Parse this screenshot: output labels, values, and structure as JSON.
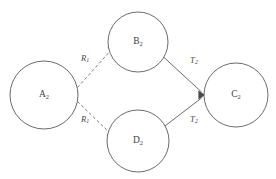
{
  "diagram": {
    "title": "",
    "background_color": "#ffffff",
    "node_stroke_color": "#5a5a5a",
    "edge_solid_color": "#5a5a5a",
    "edge_dashed_color": "#6a6a6a",
    "label_color": "#3d3d3d",
    "nodes": [
      {
        "id": "A2",
        "base": "A",
        "sub": "2",
        "cx": 44,
        "cy": 95,
        "r": 34
      },
      {
        "id": "B2",
        "base": "B",
        "sub": "2",
        "cx": 138,
        "cy": 42,
        "r": 30
      },
      {
        "id": "D2",
        "base": "D",
        "sub": "2",
        "cx": 138,
        "cy": 141,
        "r": 31
      },
      {
        "id": "C2",
        "base": "C",
        "sub": "2",
        "cx": 236,
        "cy": 95,
        "r": 32
      }
    ],
    "edges": [
      {
        "id": "A2-to-B2",
        "from": "A2",
        "to": "B2",
        "style": "dashed",
        "arrow": true,
        "base": "R",
        "sub": "1",
        "label_x": 85,
        "label_y": 59
      },
      {
        "id": "A2-to-D2",
        "from": "A2",
        "to": "D2",
        "style": "dashed",
        "arrow": true,
        "base": "R",
        "sub": "1",
        "label_x": 85,
        "label_y": 120
      },
      {
        "id": "B2-to-C2",
        "from": "B2",
        "to": "C2",
        "style": "solid",
        "arrow": true,
        "base": "T",
        "sub": "2",
        "label_x": 194,
        "label_y": 61
      },
      {
        "id": "D2-to-C2",
        "from": "D2",
        "to": "C2",
        "style": "solid",
        "arrow": true,
        "base": "T",
        "sub": "2",
        "label_x": 194,
        "label_y": 120
      }
    ]
  }
}
